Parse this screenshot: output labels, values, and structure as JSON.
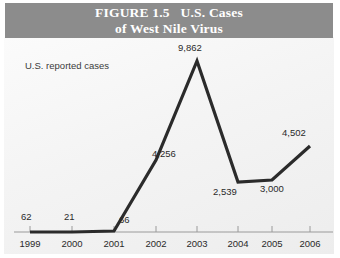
{
  "figure": {
    "title_line1": "FIGURE 1.5   U.S. Cases",
    "title_line2": "of West Nile Virus",
    "banner_color": "#8c8c8c",
    "banner_text_color": "#ffffff"
  },
  "chart_data": {
    "type": "line",
    "title": "FIGURE 1.5   U.S. Cases of West Nile Virus",
    "subtitle": "",
    "xlabel": "",
    "ylabel": "U.S. reported cases",
    "categories": [
      "1999",
      "2000",
      "2001",
      "2002",
      "2003",
      "2004",
      "2005",
      "2006"
    ],
    "values": [
      62,
      21,
      66,
      4256,
      9862,
      2539,
      3000,
      4502
    ],
    "value_labels": [
      "62",
      "21",
      "66",
      "4,256",
      "9,862",
      "2,539",
      "3,000",
      "4,502"
    ],
    "series": [
      {
        "name": "U.S. reported cases",
        "values": [
          62,
          21,
          66,
          4256,
          9862,
          2539,
          3000,
          4502
        ],
        "color": "#2b2b2b"
      }
    ],
    "ylim": [
      0,
      9862
    ],
    "grid": false,
    "legend": false,
    "line_color": "#2b2b2b",
    "axis_color": "#9a9a9a"
  },
  "axis": {
    "y_label": "U.S. reported cases"
  },
  "points": [
    {
      "year": "1999",
      "label": "62",
      "x": 30,
      "y": 232,
      "lx": 21,
      "ly": 211
    },
    {
      "year": "2000",
      "label": "21",
      "x": 72,
      "y": 232,
      "lx": 64,
      "ly": 211
    },
    {
      "year": "2001",
      "label": "66",
      "x": 114,
      "y": 231,
      "lx": 119,
      "ly": 214
    },
    {
      "year": "2002",
      "label": "4,256",
      "x": 156,
      "y": 160,
      "lx": 152,
      "ly": 148
    },
    {
      "year": "2003",
      "label": "9,862",
      "x": 197,
      "y": 61,
      "lx": 178,
      "ly": 42
    },
    {
      "year": "2004",
      "label": "2,539",
      "x": 238,
      "y": 182,
      "lx": 213,
      "ly": 186
    },
    {
      "year": "2005",
      "label": "3,000",
      "x": 272,
      "y": 180,
      "lx": 260,
      "ly": 183
    },
    {
      "year": "2006",
      "label": "4,502",
      "x": 310,
      "y": 146,
      "lx": 282,
      "ly": 127
    }
  ],
  "ticks": {
    "axis_y": 232,
    "tick_top": 226,
    "xs": [
      30,
      72,
      114,
      156,
      197,
      238,
      272,
      310
    ]
  }
}
